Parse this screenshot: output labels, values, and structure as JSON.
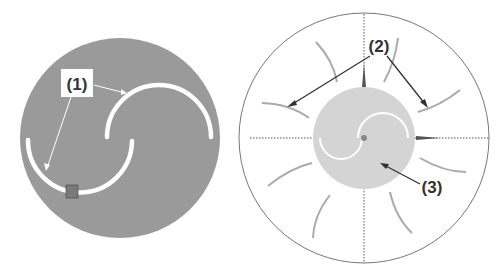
{
  "figure": {
    "left_panel": {
      "label": "(1)",
      "disc_color": "#9a9a9a",
      "blade_color": "#ffffff",
      "marker_color": "#7a7a7a"
    },
    "right_panel": {
      "label_streamlines": "(2)",
      "label_rotor": "(3)",
      "rotor_color": "#d4d4d4",
      "streamline_color": "#aaaaaa",
      "boundary_color": "#777777",
      "arrow_color": "#333333"
    }
  }
}
